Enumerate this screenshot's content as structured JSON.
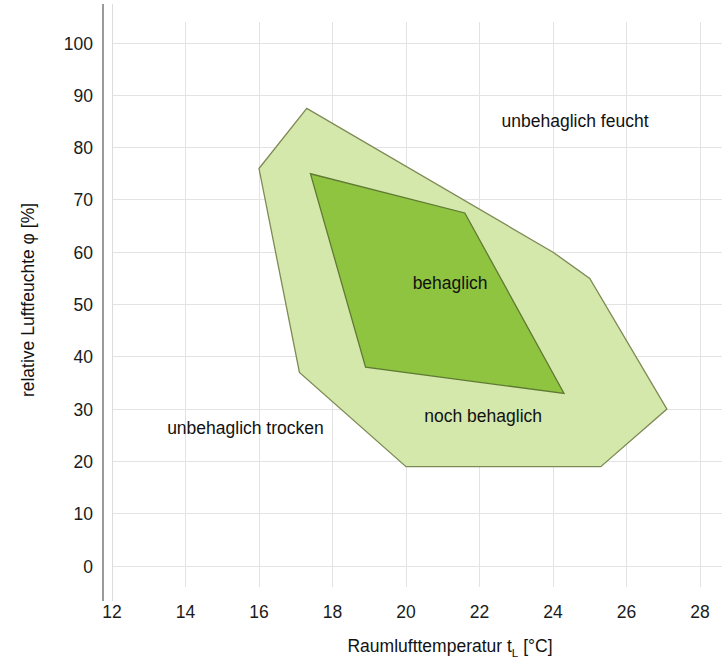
{
  "chart_data": {
    "type": "area",
    "title": "",
    "xlabel": "Raumlufttemperatur t_L [°C]",
    "xlabel_main": "Raumlufttemperatur t",
    "xlabel_sub": "L",
    "xlabel_unit": " [°C]",
    "ylabel": "relative Luftfeuchte φ [%]",
    "xlim": [
      11,
      28.6
    ],
    "ylim": [
      -4,
      104
    ],
    "xticks": [
      12,
      14,
      16,
      18,
      20,
      22,
      24,
      26,
      28
    ],
    "yticks": [
      0,
      10,
      20,
      30,
      40,
      50,
      60,
      70,
      80,
      90,
      100
    ],
    "grid": true,
    "legend_position": "none",
    "series": [
      {
        "name": "noch behaglich",
        "fill_color": "#d5e8ab",
        "stroke_color": "#7d8a54",
        "points": [
          [
            16.0,
            76.0
          ],
          [
            17.3,
            87.5
          ],
          [
            24.0,
            60.0
          ],
          [
            25.0,
            55.0
          ],
          [
            27.1,
            30.0
          ],
          [
            25.3,
            19.0
          ],
          [
            20.0,
            19.0
          ],
          [
            17.1,
            37.0
          ]
        ]
      },
      {
        "name": "behaglich",
        "fill_color": "#8fc440",
        "stroke_color": "#5f7a33",
        "points": [
          [
            17.4,
            75.0
          ],
          [
            21.6,
            67.5
          ],
          [
            24.3,
            33.0
          ],
          [
            18.9,
            38.0
          ]
        ]
      }
    ],
    "annotations": [
      {
        "text": "unbehaglich feucht",
        "x": 24.6,
        "y": 84.0,
        "anchor": "middle"
      },
      {
        "text": "behaglich",
        "x": 21.2,
        "y": 53.0,
        "anchor": "middle"
      },
      {
        "text": "noch behaglich",
        "x": 22.1,
        "y": 27.5,
        "anchor": "middle"
      },
      {
        "text": "unbehaglich trocken",
        "x": 13.5,
        "y": 25.2,
        "anchor": "start"
      }
    ],
    "colors": {
      "outer_zone": "#d5e8ab",
      "inner_zone": "#8fc440",
      "outer_stroke": "#7d8a54",
      "inner_stroke": "#5f7a33",
      "grid": "#e3e3e3",
      "axis": "#9a9a9a",
      "text": "#1b1b1b",
      "background": "#ffffff"
    }
  }
}
